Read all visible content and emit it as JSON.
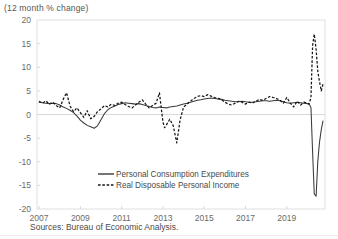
{
  "figure": {
    "subtitle": "(12 month % change)",
    "source": "Sources: Bureau of Economic Analysis."
  },
  "chart_data": {
    "type": "line",
    "title": "",
    "subtitle": "(12 month % change)",
    "xlabel": "",
    "ylabel": "",
    "xlim": [
      2006.9,
      2020.85
    ],
    "ylim": [
      -20,
      20
    ],
    "grid": false,
    "zero_line": true,
    "legend_position": "inside-bottom-center",
    "yticks": [
      20,
      15,
      10,
      5,
      0,
      -5,
      -10,
      -15,
      -20
    ],
    "ytick_labels": [
      "20",
      "15",
      "10",
      "5",
      "0",
      "-5",
      "-10",
      "-15",
      "-20"
    ],
    "xticks": [
      2007,
      2009,
      2011,
      2013,
      2015,
      2017,
      2019
    ],
    "xtick_labels": [
      "2007",
      "2009",
      "2011",
      "2013",
      "2015",
      "2017",
      "2019"
    ],
    "source": "Sources: Bureau of Economic Analysis.",
    "series": [
      {
        "name": "Personal Consumption Expenditures",
        "style": "solid",
        "color": "#3a3a3a",
        "x": [
          2007.0,
          2007.17,
          2007.33,
          2007.5,
          2007.67,
          2007.83,
          2008.0,
          2008.17,
          2008.33,
          2008.5,
          2008.67,
          2008.83,
          2009.0,
          2009.17,
          2009.33,
          2009.5,
          2009.67,
          2009.83,
          2010.0,
          2010.17,
          2010.33,
          2010.5,
          2010.67,
          2010.83,
          2011.0,
          2011.17,
          2011.33,
          2011.5,
          2011.67,
          2011.83,
          2012.0,
          2012.17,
          2012.33,
          2012.5,
          2012.67,
          2012.83,
          2013.0,
          2013.17,
          2013.33,
          2013.5,
          2013.67,
          2013.83,
          2014.0,
          2014.17,
          2014.33,
          2014.5,
          2014.67,
          2014.83,
          2015.0,
          2015.17,
          2015.33,
          2015.5,
          2015.67,
          2015.83,
          2016.0,
          2016.17,
          2016.33,
          2016.5,
          2016.67,
          2016.83,
          2017.0,
          2017.17,
          2017.33,
          2017.5,
          2017.67,
          2017.83,
          2018.0,
          2018.17,
          2018.33,
          2018.5,
          2018.67,
          2018.83,
          2019.0,
          2019.17,
          2019.33,
          2019.5,
          2019.67,
          2019.83,
          2020.0,
          2020.08,
          2020.17,
          2020.25,
          2020.33,
          2020.42,
          2020.5,
          2020.58,
          2020.67,
          2020.75
        ],
        "y": [
          2.6,
          2.5,
          2.4,
          2.3,
          2.4,
          2.3,
          2.0,
          1.6,
          1.3,
          0.9,
          0.4,
          -0.3,
          -1.2,
          -1.8,
          -2.3,
          -2.6,
          -2.9,
          -2.4,
          -1.1,
          0.2,
          1.0,
          1.5,
          1.8,
          2.1,
          2.3,
          2.5,
          2.4,
          2.3,
          2.2,
          2.3,
          2.1,
          1.9,
          1.7,
          1.5,
          1.4,
          1.6,
          1.5,
          1.4,
          1.6,
          1.7,
          1.8,
          2.0,
          2.2,
          2.4,
          2.6,
          2.8,
          3.0,
          3.1,
          3.3,
          3.4,
          3.5,
          3.4,
          3.3,
          3.2,
          3.0,
          2.9,
          2.8,
          2.7,
          2.7,
          2.8,
          2.7,
          2.6,
          2.6,
          2.7,
          2.8,
          2.9,
          2.9,
          2.8,
          2.9,
          3.0,
          2.9,
          2.7,
          2.5,
          2.4,
          2.5,
          2.6,
          2.5,
          2.4,
          2.3,
          2.2,
          1.5,
          -8.0,
          -16.8,
          -17.3,
          -10.0,
          -6.0,
          -3.2,
          -1.4
        ]
      },
      {
        "name": "Real Disposable Personal Income",
        "style": "dashed",
        "color": "#161616",
        "x": [
          2007.0,
          2007.17,
          2007.33,
          2007.5,
          2007.67,
          2007.83,
          2008.0,
          2008.17,
          2008.33,
          2008.5,
          2008.67,
          2008.83,
          2009.0,
          2009.17,
          2009.33,
          2009.5,
          2009.67,
          2009.83,
          2010.0,
          2010.17,
          2010.33,
          2010.5,
          2010.67,
          2010.83,
          2011.0,
          2011.17,
          2011.33,
          2011.5,
          2011.67,
          2011.83,
          2012.0,
          2012.17,
          2012.33,
          2012.5,
          2012.67,
          2012.83,
          2013.0,
          2013.08,
          2013.17,
          2013.33,
          2013.5,
          2013.67,
          2013.83,
          2014.0,
          2014.17,
          2014.33,
          2014.5,
          2014.67,
          2014.83,
          2015.0,
          2015.17,
          2015.33,
          2015.5,
          2015.67,
          2015.83,
          2016.0,
          2016.17,
          2016.33,
          2016.5,
          2016.67,
          2016.83,
          2017.0,
          2017.17,
          2017.33,
          2017.5,
          2017.67,
          2017.83,
          2018.0,
          2018.17,
          2018.33,
          2018.5,
          2018.67,
          2018.83,
          2019.0,
          2019.17,
          2019.33,
          2019.5,
          2019.67,
          2019.83,
          2020.0,
          2020.08,
          2020.17,
          2020.25,
          2020.33,
          2020.42,
          2020.5,
          2020.58,
          2020.67,
          2020.75
        ],
        "y": [
          2.8,
          2.4,
          2.9,
          2.2,
          2.6,
          1.9,
          1.4,
          3.2,
          4.6,
          1.8,
          0.6,
          1.4,
          0.4,
          -0.6,
          0.8,
          -0.9,
          -0.4,
          0.6,
          1.2,
          1.9,
          1.6,
          2.2,
          1.9,
          2.4,
          2.6,
          2.1,
          1.7,
          1.4,
          2.0,
          2.6,
          3.1,
          2.2,
          1.4,
          1.9,
          2.4,
          4.6,
          -1.6,
          -2.8,
          -2.2,
          -1.0,
          -2.4,
          -6.0,
          -1.2,
          1.6,
          2.2,
          2.8,
          3.4,
          3.8,
          4.0,
          3.8,
          4.2,
          3.9,
          3.6,
          3.4,
          3.2,
          2.6,
          2.2,
          2.0,
          2.4,
          2.8,
          2.6,
          2.2,
          2.6,
          2.4,
          2.8,
          3.2,
          3.0,
          3.4,
          3.8,
          3.6,
          3.4,
          3.0,
          2.4,
          3.6,
          2.4,
          1.6,
          2.8,
          2.0,
          2.6,
          2.4,
          2.2,
          3.6,
          14.6,
          17.0,
          13.8,
          9.2,
          7.0,
          5.0,
          6.4
        ]
      }
    ],
    "annotations": [
      {
        "text": "2020 spike: Real Disposable Personal Income peaks near 17%",
        "visible": false
      }
    ]
  },
  "legend": {
    "items": [
      {
        "label": "Personal Consumption Expenditures",
        "style": "solid"
      },
      {
        "label": "Real Disposable Personal Income",
        "style": "dashed"
      }
    ]
  }
}
